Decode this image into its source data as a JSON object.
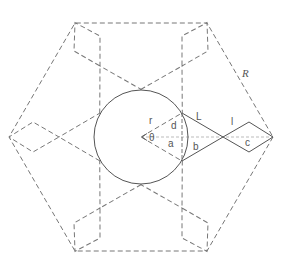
{
  "diagram": {
    "colors": {
      "solid_line": "#555555",
      "dashed_line": "#777777",
      "axis_line": "#bbbbbb",
      "label": "#555555",
      "background": "#ffffff"
    },
    "center": [
      141,
      137
    ],
    "circle_radius": 47,
    "arm_points": {
      "circle_point_upper": [
        41,
        -24
      ],
      "circle_point_lower": [
        41,
        24
      ],
      "crossing": [
        82,
        0
      ],
      "diamond_upper": [
        108,
        -15
      ],
      "diamond_lower": [
        108,
        15
      ],
      "tip": [
        132,
        0
      ]
    },
    "arm_rotations_deg": [
      0,
      60,
      120,
      180,
      240,
      300
    ],
    "labels": {
      "r": "r",
      "d": "d",
      "theta": "θ",
      "a": "a",
      "b": "b",
      "L": "L",
      "l": "l",
      "c": "c",
      "R": "R"
    }
  }
}
